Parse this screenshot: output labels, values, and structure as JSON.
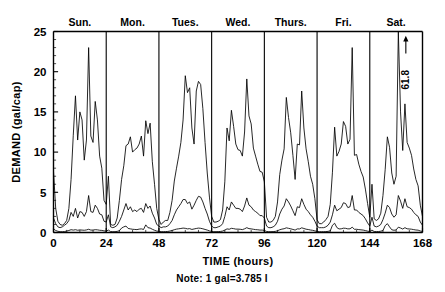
{
  "chart_data": {
    "type": "line",
    "title": "",
    "xlabel": "TIME  (hours)",
    "ylabel": "DEMAND  (gal/cap)",
    "xlim": [
      0,
      168
    ],
    "ylim": [
      0,
      25
    ],
    "xticks": [
      0,
      24,
      48,
      72,
      96,
      120,
      144,
      168
    ],
    "xticklabels": [
      "0",
      "24",
      "48",
      "72",
      "96",
      "120",
      "144",
      "168"
    ],
    "yticks": [
      0,
      5,
      10,
      15,
      20,
      25
    ],
    "yticklabels": [
      "0",
      "5",
      "10",
      "15",
      "20",
      "25"
    ],
    "x_minor_step": 6,
    "y_minor_step": 1,
    "grid": false,
    "legend": "none",
    "day_separators": [
      24,
      48,
      72,
      96,
      120,
      144
    ],
    "day_labels": [
      {
        "label": "Sun.",
        "center_hour": 12
      },
      {
        "label": "Mon.",
        "center_hour": 36
      },
      {
        "label": "Tues.",
        "center_hour": 60
      },
      {
        "label": "Wed.",
        "center_hour": 84
      },
      {
        "label": "Thurs.",
        "center_hour": 108
      },
      {
        "label": "Fri.",
        "center_hour": 132
      },
      {
        "label": "Sat.",
        "center_hour": 156
      }
    ],
    "annotations": [
      {
        "text": "61.8",
        "x_hour": 157,
        "y_value": 25,
        "note": "off-scale peak marked with up arrow"
      }
    ],
    "note": "Note:  1 gal=3.785 l",
    "series": [
      {
        "name": "high-demand-residence",
        "color": "#000000",
        "x": [
          0,
          1,
          2,
          3,
          4,
          5,
          6,
          7,
          8,
          9,
          10,
          11,
          12,
          13,
          14,
          15,
          16,
          17,
          18,
          19,
          20,
          21,
          22,
          23,
          24,
          25,
          26,
          27,
          28,
          29,
          30,
          31,
          32,
          33,
          34,
          35,
          36,
          37,
          38,
          39,
          40,
          41,
          42,
          43,
          44,
          45,
          46,
          47,
          48,
          49,
          50,
          51,
          52,
          53,
          54,
          55,
          56,
          57,
          58,
          59,
          60,
          61,
          62,
          63,
          64,
          65,
          66,
          67,
          68,
          69,
          70,
          71,
          72,
          73,
          74,
          75,
          76,
          77,
          78,
          79,
          80,
          81,
          82,
          83,
          84,
          85,
          86,
          87,
          88,
          89,
          90,
          91,
          92,
          93,
          94,
          95,
          96,
          97,
          98,
          99,
          100,
          101,
          102,
          103,
          104,
          105,
          106,
          107,
          108,
          109,
          110,
          111,
          112,
          113,
          114,
          115,
          116,
          117,
          118,
          119,
          120,
          121,
          122,
          123,
          124,
          125,
          126,
          127,
          128,
          129,
          130,
          131,
          132,
          133,
          134,
          135,
          136,
          137,
          138,
          139,
          140,
          141,
          142,
          143,
          144,
          145,
          146,
          147,
          148,
          149,
          150,
          151,
          152,
          153,
          154,
          155,
          156,
          157,
          158,
          159,
          160,
          161,
          162,
          163,
          164,
          165,
          166,
          167,
          168
        ],
        "values": [
          7.6,
          3.0,
          1.4,
          1.0,
          0.9,
          1.1,
          1.5,
          3.0,
          6.6,
          12.1,
          17.0,
          11.5,
          15.0,
          14.0,
          9.0,
          11.5,
          23.0,
          12.0,
          11.2,
          16.3,
          14.0,
          9.5,
          8.0,
          4.0,
          3.5,
          7.0,
          1.0,
          0.9,
          1.0,
          1.8,
          4.0,
          6.6,
          8.3,
          10.8,
          11.0,
          11.9,
          10.0,
          10.3,
          10.5,
          11.0,
          12.0,
          9.5,
          13.9,
          12.3,
          13.6,
          8.8,
          6.0,
          3.0,
          1.6,
          1.0,
          1.3,
          1.5,
          1.5,
          2.5,
          4.0,
          6.4,
          8.0,
          9.5,
          11.2,
          14.0,
          19.5,
          17.4,
          18.0,
          13.0,
          11.0,
          17.6,
          18.8,
          18.4,
          15.4,
          11.2,
          7.4,
          4.4,
          2.0,
          1.3,
          1.3,
          1.4,
          1.6,
          2.8,
          6.3,
          13.0,
          11.4,
          15.2,
          13.2,
          11.0,
          10.3,
          10.2,
          9.5,
          12.5,
          19.1,
          14.5,
          13.5,
          10.5,
          9.5,
          8.5,
          7.6,
          7.5,
          6.3,
          1.9,
          1.3,
          1.3,
          1.5,
          2.0,
          3.8,
          7.2,
          9.0,
          10.4,
          16.8,
          14.3,
          12.4,
          9.6,
          6.6,
          11.0,
          10.9,
          17.6,
          13.0,
          10.4,
          8.8,
          7.0,
          6.0,
          4.2,
          1.6,
          1.1,
          1.1,
          1.3,
          1.6,
          2.0,
          3.5,
          7.5,
          13.1,
          9.5,
          10.1,
          11.0,
          13.8,
          13.2,
          11.0,
          11.6,
          23.0,
          9.6,
          9.7,
          8.5,
          7.6,
          6.9,
          5.4,
          3.6,
          1.9,
          6.0,
          1.7,
          1.5,
          1.7,
          2.4,
          4.6,
          7.8,
          11.9,
          10.6,
          7.4,
          6.0,
          7.0,
          25.0,
          15.0,
          10.2,
          16.0,
          11.2,
          10.5,
          9.6,
          7.9,
          6.6,
          5.8,
          3.4,
          2.0
        ]
      },
      {
        "name": "medium-demand-residence",
        "color": "#000000",
        "x": [
          0,
          1,
          2,
          3,
          4,
          5,
          6,
          7,
          8,
          9,
          10,
          11,
          12,
          13,
          14,
          15,
          16,
          17,
          18,
          19,
          20,
          21,
          22,
          23,
          24,
          25,
          26,
          27,
          28,
          29,
          30,
          31,
          32,
          33,
          34,
          35,
          36,
          37,
          38,
          39,
          40,
          41,
          42,
          43,
          44,
          45,
          46,
          47,
          48,
          49,
          50,
          51,
          52,
          53,
          54,
          55,
          56,
          57,
          58,
          59,
          60,
          61,
          62,
          63,
          64,
          65,
          66,
          67,
          68,
          69,
          70,
          71,
          72,
          73,
          74,
          75,
          76,
          77,
          78,
          79,
          80,
          81,
          82,
          83,
          84,
          85,
          86,
          87,
          88,
          89,
          90,
          91,
          92,
          93,
          94,
          95,
          96,
          97,
          98,
          99,
          100,
          101,
          102,
          103,
          104,
          105,
          106,
          107,
          108,
          109,
          110,
          111,
          112,
          113,
          114,
          115,
          116,
          117,
          118,
          119,
          120,
          121,
          122,
          123,
          124,
          125,
          126,
          127,
          128,
          129,
          130,
          131,
          132,
          133,
          134,
          135,
          136,
          137,
          138,
          139,
          140,
          141,
          142,
          143,
          144,
          145,
          146,
          147,
          148,
          149,
          150,
          151,
          152,
          153,
          154,
          155,
          156,
          157,
          158,
          159,
          160,
          161,
          162,
          163,
          164,
          165,
          166,
          167,
          168
        ],
        "values": [
          1.8,
          1.1,
          0.7,
          0.6,
          0.7,
          0.9,
          1.1,
          1.5,
          2.5,
          2.0,
          3.0,
          1.8,
          2.6,
          2.5,
          2.0,
          2.6,
          4.6,
          2.6,
          2.5,
          3.4,
          3.0,
          2.3,
          2.2,
          1.4,
          1.3,
          2.2,
          0.7,
          0.6,
          0.7,
          0.9,
          1.4,
          2.0,
          2.8,
          3.6,
          2.8,
          3.2,
          2.6,
          2.8,
          2.6,
          2.9,
          3.0,
          2.5,
          3.6,
          3.0,
          3.3,
          2.4,
          1.8,
          1.0,
          0.8,
          0.6,
          0.7,
          0.7,
          0.8,
          1.1,
          1.5,
          2.2,
          2.8,
          3.2,
          3.6,
          4.1,
          4.1,
          3.6,
          3.8,
          2.9,
          3.4,
          4.0,
          4.5,
          4.4,
          3.8,
          3.0,
          2.3,
          1.4,
          0.8,
          0.6,
          0.6,
          0.7,
          0.8,
          1.1,
          2.0,
          3.2,
          2.8,
          3.8,
          3.4,
          3.0,
          3.0,
          2.9,
          2.6,
          3.3,
          4.3,
          3.4,
          3.2,
          2.8,
          2.6,
          2.4,
          2.1,
          2.1,
          1.8,
          0.8,
          0.6,
          0.6,
          0.7,
          0.9,
          1.4,
          2.3,
          2.9,
          3.3,
          4.2,
          3.8,
          3.3,
          2.7,
          2.1,
          3.2,
          3.1,
          4.2,
          3.5,
          2.9,
          2.6,
          2.2,
          1.9,
          1.4,
          0.8,
          0.6,
          0.6,
          0.6,
          0.7,
          0.9,
          1.3,
          2.2,
          3.4,
          2.7,
          2.9,
          3.1,
          3.7,
          3.6,
          3.1,
          3.2,
          4.6,
          2.8,
          2.8,
          2.5,
          2.3,
          2.1,
          1.7,
          1.2,
          0.8,
          1.9,
          0.8,
          0.7,
          0.8,
          1.0,
          1.6,
          2.4,
          3.4,
          3.1,
          2.3,
          1.9,
          2.2,
          4.6,
          3.9,
          3.0,
          4.2,
          3.2,
          3.1,
          2.9,
          2.5,
          2.2,
          2.0,
          1.3,
          0.9
        ]
      },
      {
        "name": "low-demand-residence",
        "color": "#000000",
        "x": [
          0,
          1,
          2,
          3,
          4,
          5,
          6,
          7,
          8,
          9,
          10,
          11,
          12,
          13,
          14,
          15,
          16,
          17,
          18,
          19,
          20,
          21,
          22,
          23,
          24,
          25,
          26,
          27,
          28,
          29,
          30,
          31,
          32,
          33,
          34,
          35,
          36,
          37,
          38,
          39,
          40,
          41,
          42,
          43,
          44,
          45,
          46,
          47,
          48,
          49,
          50,
          51,
          52,
          53,
          54,
          55,
          56,
          57,
          58,
          59,
          60,
          61,
          62,
          63,
          64,
          65,
          66,
          67,
          68,
          69,
          70,
          71,
          72,
          73,
          74,
          75,
          76,
          77,
          78,
          79,
          80,
          81,
          82,
          83,
          84,
          85,
          86,
          87,
          88,
          89,
          90,
          91,
          92,
          93,
          94,
          95,
          96,
          97,
          98,
          99,
          100,
          101,
          102,
          103,
          104,
          105,
          106,
          107,
          108,
          109,
          110,
          111,
          112,
          113,
          114,
          115,
          116,
          117,
          118,
          119,
          120,
          121,
          122,
          123,
          124,
          125,
          126,
          127,
          128,
          129,
          130,
          131,
          132,
          133,
          134,
          135,
          136,
          137,
          138,
          139,
          140,
          141,
          142,
          143,
          144,
          145,
          146,
          147,
          148,
          149,
          150,
          151,
          152,
          153,
          154,
          155,
          156,
          157,
          158,
          159,
          160,
          161,
          162,
          163,
          164,
          165,
          166,
          167,
          168
        ],
        "values": [
          0.45,
          0.25,
          0.15,
          0.1,
          0.1,
          0.12,
          0.18,
          0.25,
          0.35,
          0.3,
          0.35,
          0.28,
          0.32,
          0.3,
          0.28,
          0.32,
          0.4,
          0.3,
          0.3,
          0.35,
          0.33,
          0.28,
          0.26,
          0.2,
          0.18,
          0.3,
          0.12,
          0.1,
          0.1,
          0.14,
          0.22,
          0.55,
          0.7,
          0.8,
          0.5,
          0.45,
          0.4,
          0.38,
          0.36,
          0.42,
          0.45,
          0.38,
          0.95,
          0.6,
          0.55,
          0.4,
          0.28,
          0.18,
          0.14,
          0.1,
          0.1,
          0.11,
          0.13,
          0.18,
          0.25,
          0.35,
          0.42,
          0.46,
          0.5,
          0.55,
          0.52,
          0.45,
          0.48,
          0.38,
          0.44,
          0.5,
          0.55,
          0.52,
          0.46,
          0.38,
          0.3,
          0.2,
          0.13,
          0.1,
          0.1,
          0.11,
          0.13,
          0.18,
          0.3,
          0.45,
          0.4,
          0.52,
          0.48,
          0.42,
          0.42,
          0.4,
          0.36,
          0.46,
          0.6,
          0.48,
          0.45,
          0.4,
          0.36,
          0.34,
          0.3,
          0.3,
          0.26,
          0.13,
          0.1,
          0.1,
          0.11,
          0.14,
          0.22,
          0.34,
          0.42,
          0.47,
          0.58,
          0.52,
          0.46,
          0.38,
          0.3,
          0.45,
          0.44,
          0.58,
          0.5,
          0.41,
          0.37,
          0.31,
          0.27,
          0.2,
          0.13,
          0.1,
          0.1,
          0.1,
          0.11,
          0.14,
          0.2,
          0.9,
          1.15,
          0.62,
          0.44,
          0.46,
          0.54,
          0.52,
          0.45,
          0.46,
          0.66,
          0.4,
          0.4,
          0.36,
          0.33,
          0.3,
          0.24,
          0.17,
          0.12,
          0.3,
          0.12,
          0.11,
          0.12,
          0.16,
          0.24,
          0.85,
          1.1,
          0.7,
          0.34,
          0.28,
          0.32,
          0.66,
          0.56,
          0.43,
          0.6,
          0.46,
          0.44,
          0.41,
          0.36,
          0.31,
          0.29,
          0.19,
          0.13
        ]
      }
    ]
  }
}
